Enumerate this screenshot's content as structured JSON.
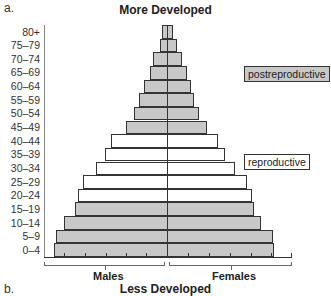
{
  "panel_a_label": "a.",
  "panel_b_label": "b.",
  "title_top": "More Developed",
  "title_bottom": "Less Developed",
  "legend": {
    "postreproductive": "postreproductive",
    "reproductive": "reproductive"
  },
  "axis": {
    "left_label": "Males",
    "right_label": "Females"
  },
  "colors": {
    "shaded": "#c8c8c8",
    "open": "#ffffff",
    "stroke": "#333333"
  },
  "chart_data": {
    "type": "bar",
    "subtype": "population_pyramid",
    "title": "More Developed",
    "xlabel": "Males | Females",
    "ylabel": "Age group",
    "categories": [
      "80+",
      "75–79",
      "70–74",
      "65–69",
      "60–64",
      "55–59",
      "50–54",
      "45–49",
      "40–44",
      "35–39",
      "30–34",
      "25–29",
      "20–24",
      "15–19",
      "10–14",
      "5–9",
      "0–4"
    ],
    "series": [
      {
        "name": "Males",
        "values": [
          5,
          7,
          14,
          17,
          23,
          28,
          33,
          41,
          56,
          62,
          71,
          84,
          89,
          92,
          103,
          111,
          113
        ]
      },
      {
        "name": "Females",
        "values": [
          6,
          10,
          15,
          20,
          24,
          27,
          32,
          40,
          51,
          58,
          68,
          80,
          85,
          87,
          94,
          106,
          107
        ]
      }
    ],
    "group_shading": {
      "postreproductive": [
        "80+",
        "75–79",
        "70–74",
        "65–69",
        "60–64",
        "55–59",
        "50–54",
        "45–49"
      ],
      "reproductive": [
        "40–44",
        "35–39",
        "30–34",
        "25–29",
        "20–24"
      ],
      "prereproductive": [
        "15–19",
        "10–14",
        "5–9",
        "0–4"
      ]
    },
    "grid": false,
    "units": "relative bar width (px from center)",
    "x_ticks_per_side": 5
  }
}
